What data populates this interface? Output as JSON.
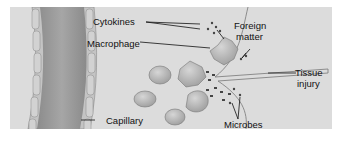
{
  "diagram": {
    "labels": {
      "cytokines": "Cytokines",
      "macrophage": "Macrophage",
      "foreign_matter_line1": "Foreign",
      "foreign_matter_line2": "matter",
      "tissue_injury_line1": "Tissue",
      "tissue_injury_line2": "injury",
      "capillary": "Capillary",
      "microbes": "Microbes"
    },
    "colors": {
      "background": "#dcdcdc",
      "capillary_wall": "#bdbdbd",
      "capillary_lumen": "#9a9a9a",
      "cell": "#b8b8b8",
      "text": "#111111"
    }
  }
}
